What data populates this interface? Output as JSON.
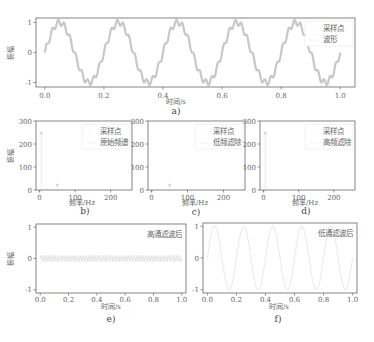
{
  "figure": {
    "captions": [
      "a)",
      "b)",
      "c)",
      "d)",
      "e)",
      "f)"
    ]
  },
  "chart_data": [
    {
      "id": "a",
      "type": "line",
      "title": "",
      "caption": "a)",
      "xlabel": "时间/s",
      "ylabel": "振幅",
      "xlim": [
        -0.03,
        1.05
      ],
      "ylim": [
        -1.15,
        1.15
      ],
      "xticks": [
        0.0,
        0.2,
        0.4,
        0.6,
        0.8,
        1.0
      ],
      "xtick_labels": [
        "0.0",
        "0.2",
        "0.4",
        "0.6",
        "0.8",
        "1.0"
      ],
      "yticks": [
        -1,
        0,
        1
      ],
      "ytick_labels": [
        "-1",
        "0",
        "1"
      ],
      "legend": [
        "采样点",
        "波形"
      ],
      "legend_position": "upper right",
      "series": [
        {
          "name": "采样点",
          "kind": "scatter",
          "signal": "sin(2π·5t)+0.1·sin(2π·50t)",
          "fs": 500
        },
        {
          "name": "波形",
          "kind": "line",
          "signal": "sin(2π·5t)+0.1·sin(2π·50t)",
          "fs": 500
        }
      ],
      "color": "#c8c8c8"
    },
    {
      "id": "b",
      "type": "bar",
      "caption": "b)",
      "xlabel": "频率/Hz",
      "ylabel": "振幅",
      "xlim": [
        -10,
        260
      ],
      "ylim": [
        0,
        300
      ],
      "xticks": [
        0,
        100,
        200
      ],
      "xtick_labels": [
        "0",
        "100",
        "200"
      ],
      "yticks": [
        0,
        100,
        200,
        300
      ],
      "ytick_labels": [
        "0",
        "100",
        "200",
        "300"
      ],
      "legend": [
        "采样点",
        "原始频谱"
      ],
      "legend_position": "upper right",
      "x": [
        5,
        50
      ],
      "values": [
        250,
        25
      ],
      "color": "#c8c8c8"
    },
    {
      "id": "c",
      "type": "bar",
      "caption": "c)",
      "xlabel": "频率/Hz",
      "ylabel": "",
      "xlim": [
        -10,
        260
      ],
      "ylim": [
        0,
        300
      ],
      "xticks": [
        0,
        100,
        200
      ],
      "xtick_labels": [
        "0",
        "100",
        "200"
      ],
      "yticks": [
        0,
        100,
        200,
        300
      ],
      "ytick_labels": [
        "0",
        "100",
        "200",
        "300"
      ],
      "legend": [
        "采样点",
        "低频滤除"
      ],
      "legend_position": "upper right",
      "x": [
        5,
        50
      ],
      "values": [
        0,
        25
      ],
      "color": "#c8c8c8"
    },
    {
      "id": "d",
      "type": "bar",
      "caption": "d)",
      "xlabel": "频率/Hz",
      "ylabel": "",
      "xlim": [
        -10,
        260
      ],
      "ylim": [
        0,
        300
      ],
      "xticks": [
        0,
        100,
        200
      ],
      "xtick_labels": [
        "0",
        "100",
        "200"
      ],
      "yticks": [
        0,
        100,
        200,
        300
      ],
      "ytick_labels": [
        "0",
        "100",
        "200",
        "300"
      ],
      "legend": [
        "采样点",
        "高频滤除"
      ],
      "legend_position": "upper right",
      "x": [
        5,
        50
      ],
      "values": [
        250,
        0
      ],
      "color": "#c8c8c8"
    },
    {
      "id": "e",
      "type": "line",
      "caption": "e)",
      "xlabel": "时间/s",
      "ylabel": "振幅",
      "xlim": [
        -0.03,
        1.03
      ],
      "ylim": [
        -1.1,
        1.1
      ],
      "xticks": [
        0.0,
        0.2,
        0.4,
        0.6,
        0.8,
        1.0
      ],
      "xtick_labels": [
        "0.0",
        "0.2",
        "0.4",
        "0.6",
        "0.8",
        "1.0"
      ],
      "yticks": [
        -1,
        0,
        1
      ],
      "ytick_labels": [
        "-1",
        "0",
        "1"
      ],
      "legend": [
        "高通滤波后"
      ],
      "legend_position": "upper right",
      "series": [
        {
          "name": "高通滤波后",
          "signal": "0.1·sin(2π·50t)"
        }
      ],
      "color": "#e6e6e6"
    },
    {
      "id": "f",
      "type": "line",
      "caption": "f)",
      "xlabel": "时间/s",
      "ylabel": "",
      "xlim": [
        -0.03,
        1.03
      ],
      "ylim": [
        -1.1,
        1.1
      ],
      "xticks": [
        0.0,
        0.2,
        0.4,
        0.6,
        0.8,
        1.0
      ],
      "xtick_labels": [
        "0.0",
        "0.2",
        "0.4",
        "0.6",
        "0.8",
        "1.0"
      ],
      "yticks": [
        -1,
        0,
        1
      ],
      "ytick_labels": [
        "-1",
        "0",
        "1"
      ],
      "legend": [
        "低通滤波后"
      ],
      "legend_position": "upper right",
      "series": [
        {
          "name": "低通滤波后",
          "signal": "sin(2π·5t)"
        }
      ],
      "color": "#ececec"
    }
  ]
}
